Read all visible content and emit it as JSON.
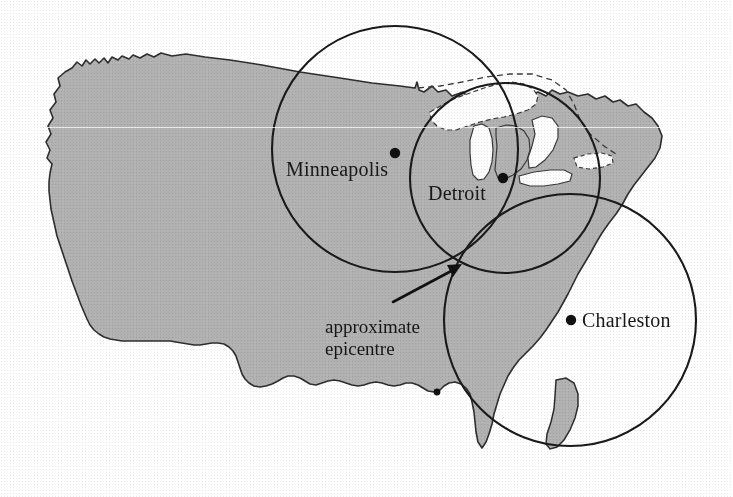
{
  "figure": {
    "type": "map-diagram",
    "background_color": "#ffffff",
    "landmass_fill": "#b0b0b0",
    "outline_color": "#2b2b2b",
    "circle_color": "#1a1a1a",
    "width": 733,
    "height": 497
  },
  "cities": [
    {
      "name": "Minneapolis",
      "dot": {
        "x": 395,
        "y": 153
      },
      "label": {
        "x": 286,
        "y": 158
      },
      "circle": {
        "cx": 395,
        "cy": 149,
        "r": 123
      }
    },
    {
      "name": "Detroit",
      "dot": {
        "x": 503,
        "y": 178
      },
      "label": {
        "x": 428,
        "y": 182
      },
      "circle": {
        "cx": 505,
        "cy": 178,
        "r": 95
      }
    },
    {
      "name": "Charleston",
      "dot": {
        "x": 571,
        "y": 320
      },
      "label": {
        "x": 582,
        "y": 325
      },
      "circle": {
        "cx": 570,
        "cy": 320,
        "r": 126
      }
    }
  ],
  "annotation": {
    "line1": "approximate",
    "line2": "epicentre",
    "text_position": {
      "x": 325,
      "y": 316
    },
    "arrow": {
      "from": {
        "x": 393,
        "y": 302
      },
      "to": {
        "x": 459,
        "y": 266
      }
    },
    "epicentre_point": {
      "x": 462,
      "y": 264
    }
  },
  "legend": {
    "present": false
  }
}
